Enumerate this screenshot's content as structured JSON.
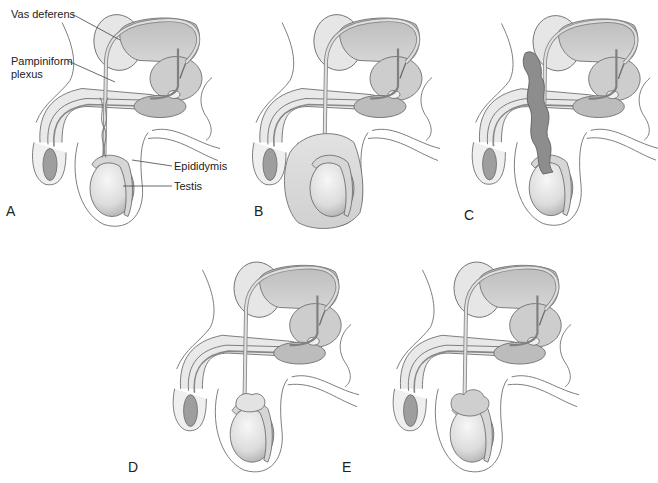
{
  "figure": {
    "panels": [
      {
        "id": "A",
        "letter": "A",
        "condition": "normal"
      },
      {
        "id": "B",
        "letter": "B",
        "condition": "hydrocele"
      },
      {
        "id": "C",
        "letter": "C",
        "condition": "varicocele"
      },
      {
        "id": "D",
        "letter": "D",
        "condition": "spermatocele"
      },
      {
        "id": "E",
        "letter": "E",
        "condition": "epididymal-mass"
      }
    ],
    "labels": {
      "vas_deferens": "Vas deferens",
      "pampiniform_line1": "Pampiniform",
      "pampiniform_line2": "plexus",
      "epididymis": "Epididymis",
      "testis": "Testis"
    }
  },
  "colors": {
    "outline": "#6f6f6f",
    "light_fill": "#e9e9e9",
    "mid_fill": "#c9c9c9",
    "dark_fill": "#a9a9a9",
    "vein_fill": "#8d8d8d",
    "background": "#ffffff"
  }
}
